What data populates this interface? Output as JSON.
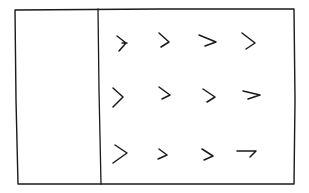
{
  "sketch": {
    "frame": {
      "x1": 15,
      "y1": 9,
      "x2": 294,
      "y2": 184
    },
    "divider_x": 100,
    "left_panel": {
      "label": ""
    },
    "right_panel": {
      "rows": 3,
      "cols": 4,
      "marks": [
        {
          "row": 1,
          "col": 1,
          "glyph": "chevron-right-icon"
        },
        {
          "row": 1,
          "col": 2,
          "glyph": "chevron-right-icon"
        },
        {
          "row": 1,
          "col": 3,
          "glyph": "chevron-right-icon"
        },
        {
          "row": 1,
          "col": 4,
          "glyph": "chevron-right-icon"
        },
        {
          "row": 2,
          "col": 1,
          "glyph": "chevron-right-icon"
        },
        {
          "row": 2,
          "col": 2,
          "glyph": "chevron-right-icon"
        },
        {
          "row": 2,
          "col": 3,
          "glyph": "chevron-right-icon"
        },
        {
          "row": 2,
          "col": 4,
          "glyph": "chevron-right-icon"
        },
        {
          "row": 3,
          "col": 1,
          "glyph": "chevron-right-icon"
        },
        {
          "row": 3,
          "col": 2,
          "glyph": "chevron-right-icon"
        },
        {
          "row": 3,
          "col": 3,
          "glyph": "chevron-right-icon"
        },
        {
          "row": 3,
          "col": 4,
          "glyph": "hook-icon"
        }
      ]
    },
    "colors": {
      "ink": "#1a1a1a",
      "paper": "#ffffff"
    }
  }
}
